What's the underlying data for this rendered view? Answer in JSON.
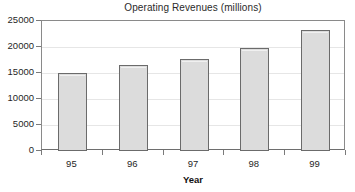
{
  "chart_data": {
    "type": "bar",
    "title": "Operating Revenues (millions)",
    "xlabel": "Year",
    "ylabel": "",
    "categories": [
      "95",
      "96",
      "97",
      "98",
      "99"
    ],
    "values": [
      15000,
      16500,
      17700,
      19800,
      23300
    ],
    "ylim": [
      0,
      25000
    ],
    "yticks": [
      0,
      5000,
      10000,
      15000,
      20000,
      25000
    ],
    "ytick_labels": [
      "0",
      "5000",
      "10000",
      "15000",
      "20000",
      "25000"
    ],
    "grid": true,
    "legend": null,
    "series": [
      {
        "name": "Operating Revenues",
        "values": [
          15000,
          16500,
          17700,
          19800,
          23300
        ]
      }
    ],
    "colors": {
      "bar_fill": "#dcdcdc",
      "bar_border": "#6b6b6b",
      "axis": "#8a8a8a",
      "gridline": "#e6e6e6",
      "text": "#1f1f1f"
    }
  }
}
